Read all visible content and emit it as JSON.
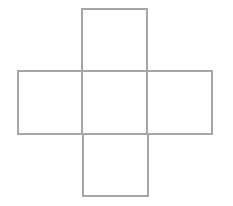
{
  "diagram": {
    "type": "cross-shaped net of five squares",
    "stroke_color": "#a6a6a6",
    "stroke_width": 2,
    "squares": [
      {
        "id": "top",
        "x": 82,
        "y": 9,
        "w": 65,
        "h": 62
      },
      {
        "id": "left",
        "x": 18,
        "y": 71,
        "w": 64,
        "h": 63
      },
      {
        "id": "center",
        "x": 82,
        "y": 71,
        "w": 65,
        "h": 63
      },
      {
        "id": "right",
        "x": 147,
        "y": 71,
        "w": 65,
        "h": 63
      },
      {
        "id": "bottom",
        "x": 83,
        "y": 134,
        "w": 65,
        "h": 62
      }
    ]
  }
}
